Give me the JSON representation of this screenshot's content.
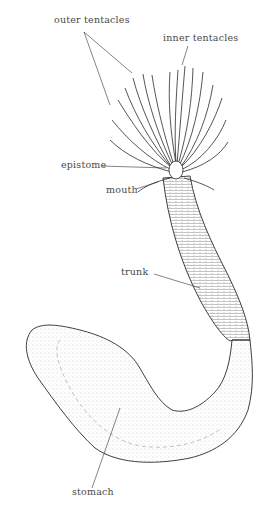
{
  "figure": {
    "labels": {
      "outer_tentacles": "outer tentacles",
      "inner_tentacles": "inner tentacles",
      "epistome": "epistome",
      "mouth": "mouth",
      "trunk": "trunk",
      "stomach": "stomach"
    },
    "colors": {
      "line": "#2a2a2a",
      "label": "#4a4a4a",
      "stipple": "#8a8a8a"
    }
  }
}
